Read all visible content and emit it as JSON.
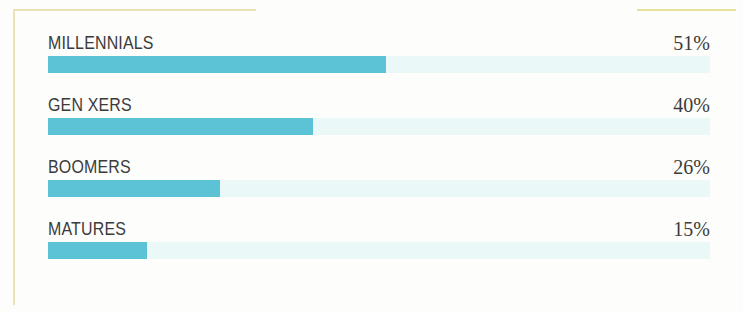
{
  "frame": {
    "accent_color": "#e9e2b4",
    "accent_color_right": "#e9e09a"
  },
  "chart_data": {
    "type": "bar",
    "orientation": "horizontal",
    "title": "",
    "subtitle": "",
    "xlabel": "",
    "ylabel": "",
    "xlim": [
      0,
      100
    ],
    "grid": false,
    "legend": null,
    "value_suffix": "%",
    "bar_fill_color": "#5cc3d6",
    "bar_track_color": "#eaf8f7",
    "label_color": "#3b3b3b",
    "categories": [
      "MILLENNIALS",
      "GEN XERS",
      "BOOMERS",
      "MATURES"
    ],
    "values": [
      51,
      40,
      26,
      15
    ],
    "value_labels": [
      "51%",
      "40%",
      "26%",
      "15%"
    ],
    "rows": [
      {
        "label": "MILLENNIALS",
        "value": 51,
        "value_label": "51%"
      },
      {
        "label": "GEN XERS",
        "value": 40,
        "value_label": "40%"
      },
      {
        "label": "BOOMERS",
        "value": 26,
        "value_label": "26%"
      },
      {
        "label": "MATURES",
        "value": 15,
        "value_label": "15%"
      }
    ]
  }
}
